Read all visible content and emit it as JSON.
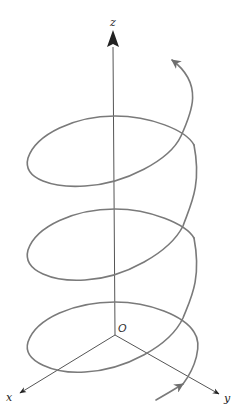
{
  "figure": {
    "axes": {
      "z_label": "z",
      "x_label": "x",
      "y_label": "y",
      "origin_label": "O"
    },
    "colors": {
      "helix": "#7a7a7a",
      "axis": "#555555",
      "arrowhead": "#222222",
      "background": "#ffffff"
    },
    "helix": {
      "turns": 3,
      "direction": "counterclockwise-upward",
      "start_arrow": "bottom-right",
      "end_arrow": "top-right"
    }
  }
}
